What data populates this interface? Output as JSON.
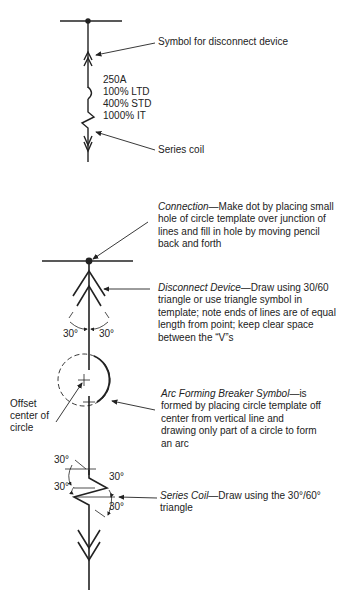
{
  "top_diagram": {
    "callout_disconnect": "Symbol for disconnect device",
    "ratings": [
      "250A",
      "100% LTD",
      "400% STD",
      "1000% IT"
    ],
    "callout_series_coil": "Series coil"
  },
  "bottom_diagram": {
    "connection": {
      "title": "Connection",
      "text": "—Make dot by placing small hole of circle template over junction of lines and fill in hole by moving pencil back and forth"
    },
    "disconnect": {
      "title": "Disconnect Device",
      "text": "—Draw using 30/60 triangle or use triangle symbol in template; note ends of lines are of equal length from point; keep clear space between the “V”s"
    },
    "arc_breaker": {
      "title": "Arc Forming Breaker Symbol",
      "text": "—is formed by placing circle template off center from vertical line and drawing only part of a circle to form an arc"
    },
    "series_coil": {
      "title": "Series Coil",
      "text": "—Draw using the 30°/60° triangle"
    },
    "offset_label": [
      "Offset",
      "center of",
      "circle"
    ],
    "angle_labels": {
      "disconnect_left": "30°",
      "disconnect_right": "30°",
      "coil_top_left": "30°",
      "coil_right_upper": "30°",
      "coil_left_lower": "30°",
      "coil_right_lower": "30°"
    }
  }
}
